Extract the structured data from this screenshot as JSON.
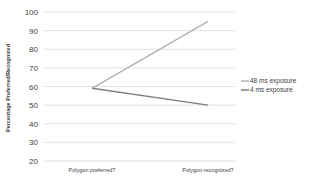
{
  "chart_data": {
    "type": "line",
    "title": "",
    "xlabel": "",
    "ylabel": "Percentage Preferred/Recognized",
    "categories": [
      "Polygon preferred?",
      "Polygon recognized?"
    ],
    "series": [
      {
        "name": "48 ms exposure",
        "values": [
          59,
          95
        ],
        "color": "#b3b3b3"
      },
      {
        "name": "4 ms exposure",
        "values": [
          59,
          50
        ],
        "color": "#7f7f7f"
      }
    ],
    "ylim": [
      20,
      100
    ],
    "yticks": [
      20,
      30,
      40,
      50,
      60,
      70,
      80,
      90,
      100
    ],
    "grid": true,
    "legend_position": "right"
  }
}
